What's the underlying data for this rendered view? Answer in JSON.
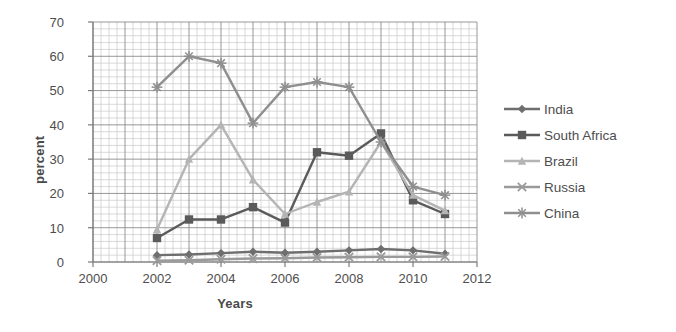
{
  "chart_data": {
    "type": "line",
    "title": "",
    "xlabel": "Years",
    "ylabel": "percent",
    "xlim": [
      2000,
      2012
    ],
    "ylim": [
      0,
      70
    ],
    "xticks": [
      2000,
      2002,
      2004,
      2006,
      2008,
      2010,
      2012
    ],
    "yticks": [
      0,
      10,
      20,
      30,
      40,
      50,
      60,
      70
    ],
    "grid": true,
    "minor_grid": true,
    "legend_position": "right",
    "x": [
      2002,
      2003,
      2004,
      2005,
      2006,
      2007,
      2008,
      2009,
      2010,
      2011
    ],
    "series": [
      {
        "name": "India",
        "marker": "diamond",
        "color": "#6e6e6e",
        "values": [
          2.0,
          2.2,
          2.6,
          3.0,
          2.7,
          3.0,
          3.4,
          3.8,
          3.4,
          2.4
        ]
      },
      {
        "name": "South Africa",
        "marker": "square",
        "color": "#5a5a5a",
        "values": [
          7.0,
          12.4,
          12.4,
          16.0,
          11.5,
          32.0,
          31.0,
          37.5,
          18.0,
          14.0
        ]
      },
      {
        "name": "Brazil",
        "marker": "triangle",
        "color": "#b4b4b4",
        "values": [
          9.5,
          30.0,
          40.0,
          24.0,
          14.0,
          17.5,
          20.5,
          35.0,
          19.5,
          15.0
        ]
      },
      {
        "name": "Russia",
        "marker": "x",
        "color": "#9a9a9a",
        "values": [
          0.4,
          0.5,
          0.8,
          1.0,
          1.1,
          1.3,
          1.4,
          1.5,
          1.5,
          1.6
        ]
      },
      {
        "name": "China",
        "marker": "asterisk",
        "color": "#8f8f8f",
        "values": [
          51.0,
          60.0,
          58.0,
          40.5,
          51.0,
          52.5,
          51.0,
          35.0,
          22.0,
          19.5
        ]
      }
    ]
  },
  "axis": {
    "ylabel": "percent",
    "xlabel": "Years",
    "yticks": [
      "0",
      "10",
      "20",
      "30",
      "40",
      "50",
      "60",
      "70"
    ],
    "xticks": [
      "2000",
      "2002",
      "2004",
      "2006",
      "2008",
      "2010",
      "2012"
    ]
  },
  "legend": {
    "items": [
      {
        "label": "India",
        "color": "#6e6e6e",
        "marker": "diamond"
      },
      {
        "label": "South Africa",
        "color": "#5a5a5a",
        "marker": "square"
      },
      {
        "label": "Brazil",
        "color": "#b4b4b4",
        "marker": "triangle"
      },
      {
        "label": "Russia",
        "color": "#9a9a9a",
        "marker": "x"
      },
      {
        "label": "China",
        "color": "#8f8f8f",
        "marker": "asterisk"
      }
    ]
  },
  "colors": {
    "grid_major": "#8c8c8c",
    "grid_minor": "#c8c8c8",
    "axis": "#7a7a7a",
    "text": "#4d4d4d",
    "background": "#ffffff"
  }
}
